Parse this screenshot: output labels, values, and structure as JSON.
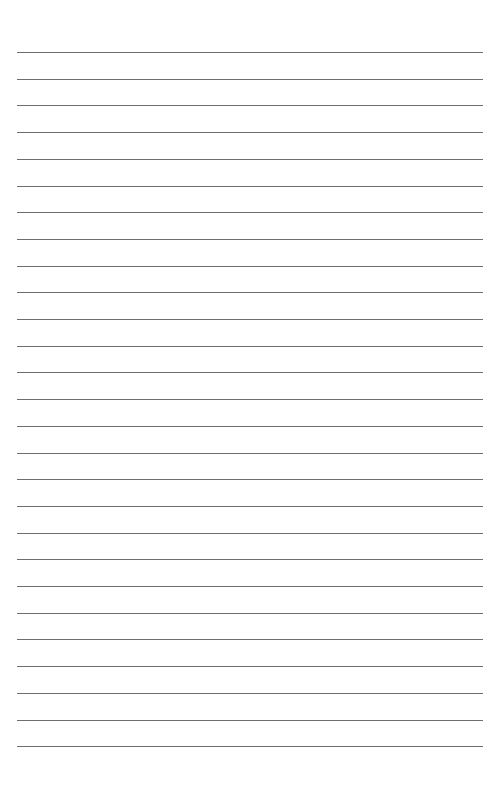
{
  "page": {
    "type": "lined paper",
    "line_count": 27,
    "first_line_y": 52,
    "line_spacing": 26.7,
    "line_left": 17,
    "line_width": 466,
    "line_color": "#6e6e6e",
    "background": "#ffffff"
  }
}
